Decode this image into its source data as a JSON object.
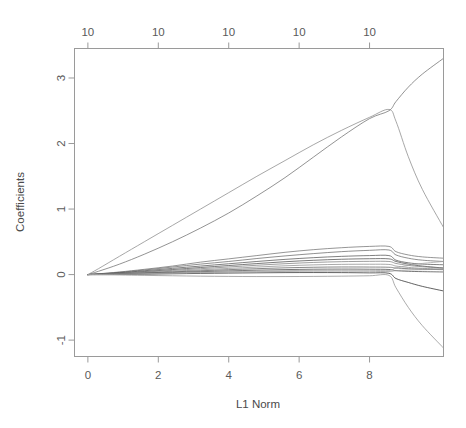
{
  "chart_data": {
    "type": "line",
    "title": "",
    "xlabel": "L1 Norm",
    "ylabel": "Coefficients",
    "xlim": [
      -0.38,
      10.1
    ],
    "ylim": [
      -1.25,
      3.45
    ],
    "grid": false,
    "legend": null,
    "xticks": [
      0,
      2,
      4,
      6,
      8
    ],
    "xtick_labels": [
      "0",
      "2",
      "4",
      "6",
      "8"
    ],
    "yticks": [
      -1,
      0,
      1,
      2,
      3
    ],
    "ytick_labels": [
      "-1",
      "0",
      "1",
      "2",
      "3"
    ],
    "top_axis": {
      "label": "",
      "ticks": [
        0,
        2,
        4,
        6,
        8
      ],
      "tick_labels": [
        "10",
        "10",
        "10",
        "10",
        "10"
      ]
    },
    "x": [
      0,
      0.3,
      0.9,
      1.6,
      2.4,
      3.2,
      4.0,
      4.8,
      5.6,
      6.4,
      7.2,
      8.0,
      8.55,
      8.75,
      9.1,
      9.5,
      10.1
    ],
    "series": [
      {
        "name": "coef-1",
        "color": "#8a8a8a",
        "values": [
          0,
          0.09,
          0.28,
          0.5,
          0.75,
          1.0,
          1.25,
          1.5,
          1.74,
          1.98,
          2.2,
          2.4,
          2.52,
          2.34,
          1.8,
          1.3,
          0.72
        ]
      },
      {
        "name": "coef-2",
        "color": "#6f6f6f",
        "values": [
          0,
          0.05,
          0.16,
          0.31,
          0.5,
          0.71,
          0.94,
          1.2,
          1.48,
          1.79,
          2.1,
          2.38,
          2.5,
          2.64,
          2.86,
          3.06,
          3.3
        ]
      },
      {
        "name": "coef-3",
        "color": "#737373",
        "values": [
          0,
          0.012,
          0.04,
          0.08,
          0.13,
          0.19,
          0.24,
          0.29,
          0.34,
          0.38,
          0.41,
          0.43,
          0.43,
          0.35,
          0.3,
          0.27,
          0.25
        ]
      },
      {
        "name": "coef-4",
        "color": "#6b6b6b",
        "values": [
          0,
          0.01,
          0.035,
          0.07,
          0.115,
          0.16,
          0.2,
          0.245,
          0.285,
          0.32,
          0.35,
          0.37,
          0.375,
          0.3,
          0.25,
          0.22,
          0.2
        ]
      },
      {
        "name": "coef-5",
        "color": "#555555",
        "values": [
          0,
          0.008,
          0.028,
          0.058,
          0.095,
          0.13,
          0.165,
          0.2,
          0.232,
          0.258,
          0.278,
          0.29,
          0.29,
          0.22,
          0.18,
          0.16,
          0.15
        ]
      },
      {
        "name": "coef-6",
        "color": "#4d4d4d",
        "values": [
          0,
          0.006,
          0.022,
          0.046,
          0.077,
          0.108,
          0.138,
          0.168,
          0.196,
          0.218,
          0.234,
          0.242,
          0.24,
          0.2,
          0.16,
          0.13,
          0.1
        ]
      },
      {
        "name": "coef-7",
        "color": "#7d7d7d",
        "values": [
          0,
          0.005,
          0.018,
          0.038,
          0.064,
          0.09,
          0.116,
          0.142,
          0.166,
          0.185,
          0.197,
          0.202,
          0.2,
          0.17,
          0.14,
          0.12,
          0.1
        ]
      },
      {
        "name": "coef-8",
        "color": "#8c8c8c",
        "values": [
          0,
          0.004,
          0.014,
          0.03,
          0.051,
          0.073,
          0.094,
          0.115,
          0.134,
          0.148,
          0.156,
          0.158,
          0.155,
          0.13,
          0.11,
          0.095,
          0.085
        ]
      },
      {
        "name": "coef-9",
        "color": "#606060",
        "values": [
          0,
          0.003,
          0.011,
          0.024,
          0.041,
          0.058,
          0.075,
          0.09,
          0.103,
          0.112,
          0.116,
          0.115,
          0.112,
          0.1,
          0.09,
          0.082,
          0.075
        ]
      },
      {
        "name": "coef-10",
        "color": "#4a4a4a",
        "values": [
          0,
          0.002,
          0.008,
          0.018,
          0.031,
          0.044,
          0.056,
          0.067,
          0.076,
          0.082,
          0.084,
          0.082,
          0.078,
          0.06,
          0.05,
          0.045,
          0.04
        ]
      },
      {
        "name": "coef-11",
        "color": "#2e2e2e",
        "values": [
          0,
          0.0,
          0.002,
          0.006,
          0.012,
          0.018,
          0.023,
          0.027,
          0.03,
          0.031,
          0.03,
          0.026,
          0.02,
          -0.06,
          -0.12,
          -0.18,
          -0.25
        ]
      },
      {
        "name": "coef-12",
        "color": "#909090",
        "values": [
          0,
          -0.002,
          -0.006,
          -0.012,
          -0.018,
          -0.024,
          -0.028,
          -0.03,
          -0.03,
          -0.028,
          -0.024,
          -0.018,
          -0.012,
          -0.2,
          -0.5,
          -0.78,
          -1.12
        ]
      },
      {
        "name": "coef-13",
        "color": "#9a9a9a",
        "values": [
          0,
          0.001,
          0.005,
          0.012,
          0.02,
          0.028,
          0.036,
          0.043,
          0.048,
          0.051,
          0.052,
          0.05,
          0.046,
          0.06,
          0.07,
          0.075,
          0.08
        ]
      },
      {
        "name": "coef-14",
        "color": "#a2a2a2",
        "values": [
          0,
          0.0015,
          0.006,
          0.014,
          0.024,
          0.034,
          0.044,
          0.053,
          0.06,
          0.065,
          0.067,
          0.066,
          0.062,
          0.1,
          0.14,
          0.17,
          0.2
        ]
      }
    ]
  }
}
